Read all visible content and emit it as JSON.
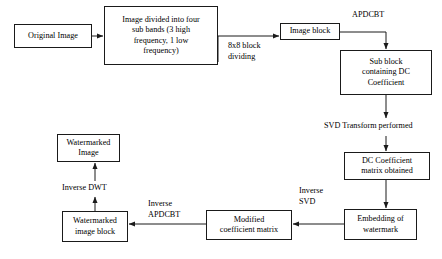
{
  "diagram": {
    "stroke_color": "#1a1a1a",
    "background_color": "#ffffff",
    "nodes": [
      {
        "id": "original_image",
        "text": "Original Image"
      },
      {
        "id": "sub_bands",
        "text": "Image divided into four\nsub bands (3 high\nfrequency, 1 low\nfrequency)"
      },
      {
        "id": "image_block",
        "text": "Image block"
      },
      {
        "id": "sub_block_dc",
        "text": "Sub block\ncontaining DC\nCoefficient"
      },
      {
        "id": "dc_matrix",
        "text": "DC Coefficient\nmatrix obtained"
      },
      {
        "id": "embedding_watermark",
        "text": "Embedding of\nwatermark"
      },
      {
        "id": "modified_coeff_matrix",
        "text": "Modified\ncoefficient matrix"
      },
      {
        "id": "watermarked_block",
        "text": "Watermarked\nimage block"
      },
      {
        "id": "watermarked_image",
        "text": "Watermarked\nImage"
      }
    ],
    "edge_labels": [
      {
        "id": "block_dividing",
        "text": "8x8 block\ndividing"
      },
      {
        "id": "apdcbt",
        "text": "APDCBT"
      },
      {
        "id": "svd_transform",
        "text": "SVD Transform performed"
      },
      {
        "id": "inverse_svd",
        "text": "Inverse\nSVD"
      },
      {
        "id": "inverse_apdcbt",
        "text": "Inverse\nAPDCBT"
      },
      {
        "id": "inverse_dwt",
        "text": "Inverse DWT"
      }
    ]
  }
}
